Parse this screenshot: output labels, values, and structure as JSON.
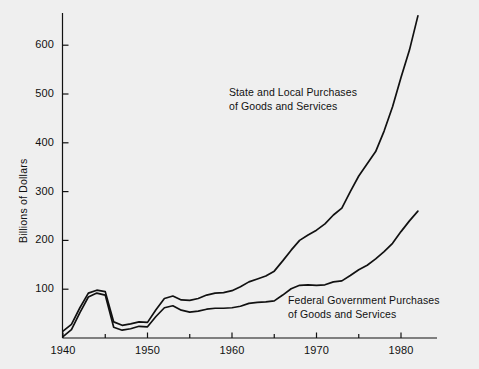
{
  "chart_data": {
    "type": "line",
    "title": "",
    "subtitle": "",
    "xlabel": "",
    "ylabel": "Billions of Dollars",
    "xlim": [
      1939,
      1984
    ],
    "ylim": [
      0,
      690
    ],
    "grid": false,
    "legend_position": "inline-annotations",
    "x_ticks_major": [
      "1940",
      "1950",
      "1960",
      "1970",
      "1980"
    ],
    "x_ticks_major_values": [
      1940,
      1950,
      1960,
      1970,
      1980
    ],
    "x_ticks_minor_values": [
      1945,
      1955,
      1965,
      1975
    ],
    "y_ticks": [
      "100",
      "200",
      "300",
      "400",
      "500",
      "600"
    ],
    "y_tick_values": [
      100,
      200,
      300,
      400,
      500,
      600
    ],
    "x": [
      1940,
      1941,
      1942,
      1943,
      1944,
      1945,
      1946,
      1947,
      1948,
      1949,
      1950,
      1951,
      1952,
      1953,
      1954,
      1955,
      1956,
      1957,
      1958,
      1959,
      1960,
      1961,
      1962,
      1963,
      1964,
      1965,
      1966,
      1967,
      1968,
      1969,
      1970,
      1971,
      1972,
      1973,
      1974,
      1975,
      1976,
      1977,
      1978,
      1979,
      1980,
      1981,
      1982
    ],
    "series": [
      {
        "name": "State and Local Purchases of Goods and Services",
        "values": [
          14,
          28,
          62,
          92,
          98,
          95,
          33,
          26,
          29,
          33,
          32,
          58,
          81,
          86,
          78,
          77,
          81,
          88,
          92,
          93,
          97,
          105,
          115,
          121,
          127,
          137,
          158,
          180,
          200,
          211,
          221,
          234,
          252,
          266,
          300,
          332,
          357,
          382,
          424,
          474,
          534,
          590,
          660
        ]
      },
      {
        "name": "Federal Government Purchases of Goods and Services",
        "values": [
          3,
          17,
          52,
          84,
          92,
          88,
          22,
          16,
          19,
          24,
          23,
          44,
          62,
          66,
          57,
          53,
          55,
          59,
          61,
          61,
          62,
          65,
          71,
          73,
          74,
          76,
          88,
          101,
          108,
          109,
          108,
          109,
          115,
          117,
          128,
          140,
          149,
          162,
          177,
          194,
          218,
          240,
          260
        ]
      }
    ],
    "annotations": [
      {
        "id": "state-local-label",
        "lines": [
          "State and Local Purchases",
          "of Goods and Services"
        ],
        "x_px": 229,
        "y_px": 86
      },
      {
        "id": "federal-label",
        "lines": [
          "Federal Government Purchases",
          "of Goods and Services"
        ],
        "x_px": 288,
        "y_px": 294
      }
    ],
    "colors": {
      "background": "#efefef",
      "line": "#111111",
      "axis": "#111111",
      "text": "#111111"
    }
  }
}
